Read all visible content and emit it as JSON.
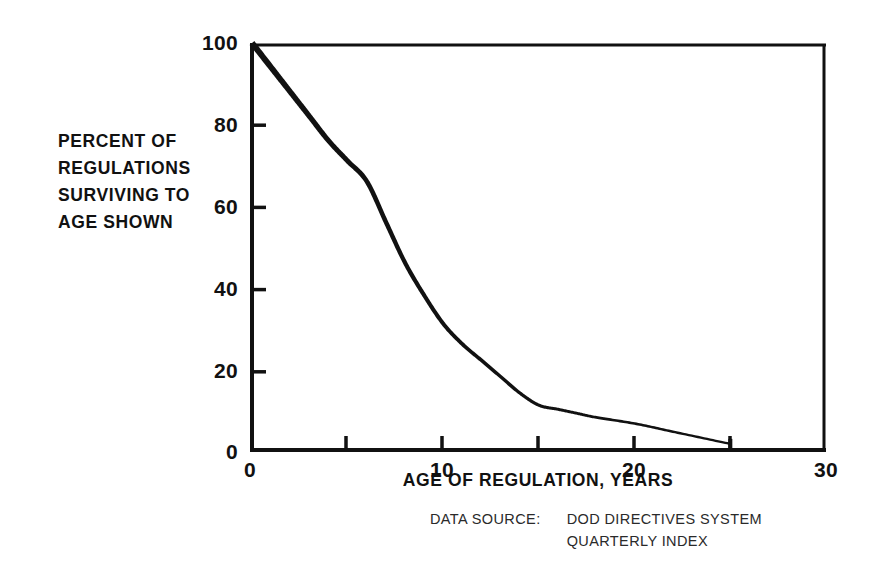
{
  "chart_data": {
    "type": "line",
    "title": "",
    "xlabel": "AGE OF REGULATION, YEARS",
    "ylabel": "PERCENT OF REGULATIONS SURVIVING TO AGE SHOWN",
    "xlim": [
      0,
      30
    ],
    "ylim": [
      0,
      100
    ],
    "grid": false,
    "legend": null,
    "x_ticks": [
      0,
      5,
      10,
      15,
      20,
      25,
      30
    ],
    "x_tick_labels": [
      "0",
      "",
      "10",
      "",
      "20",
      "",
      "30"
    ],
    "y_ticks": [
      0,
      20,
      40,
      60,
      80,
      100
    ],
    "y_tick_labels": [
      "0",
      "20",
      "40",
      "60",
      "80",
      "100"
    ],
    "series": [
      {
        "name": "Percent of regulations surviving",
        "color": "#111111",
        "x": [
          0,
          1,
          2,
          3,
          4,
          5,
          6,
          7,
          8,
          9,
          10,
          11,
          12,
          13,
          14,
          15,
          16,
          17,
          18,
          20,
          22,
          25
        ],
        "values": [
          100,
          94,
          88,
          82,
          76,
          71,
          66,
          56,
          46,
          38,
          31,
          26,
          22,
          18,
          14,
          11,
          10,
          9,
          8,
          6.5,
          4.5,
          1.5
        ]
      }
    ],
    "annotations": [
      "Curve terminates at age 25 with an end marker dropping to 0 percent."
    ]
  },
  "axis_label_lines": {
    "y": [
      "PERCENT OF",
      "REGULATIONS",
      "SURVIVING TO",
      "AGE SHOWN"
    ]
  },
  "source": {
    "label": "DATA SOURCE:",
    "lines": [
      "DOD DIRECTIVES SYSTEM",
      "QUARTERLY INDEX"
    ]
  }
}
